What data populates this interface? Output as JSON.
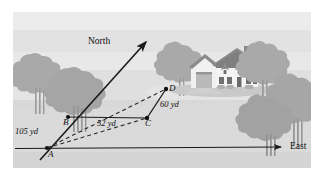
{
  "figure": {
    "background_color": "#ffffff",
    "scene_color": "#d9d9d9",
    "sky_band_color": "#e6e6e6",
    "mid_band_color": "#dedede",
    "ground_color": "#d5d5d5",
    "tree_color": "#a8a8a8",
    "tree_trunk_color": "#8f8f8f",
    "house_wall_color": "#f2f2f2",
    "house_roof_color": "#8d8d8d",
    "line_color": "#1a1a1a"
  },
  "direction_labels": {
    "north": "North",
    "east": "East"
  },
  "points": [
    {
      "id": "A",
      "label": "A",
      "x": 47,
      "y": 148
    },
    {
      "id": "B",
      "label": "B",
      "x": 68,
      "y": 117
    },
    {
      "id": "C",
      "label": "C",
      "x": 147,
      "y": 118
    },
    {
      "id": "D",
      "label": "D",
      "x": 166,
      "y": 89
    }
  ],
  "measurements": [
    {
      "id": "AB",
      "label": "105 yd",
      "value": 105,
      "unit": "yd",
      "from": "A",
      "to": "B"
    },
    {
      "id": "BC",
      "label": "52 yd",
      "value": 52,
      "unit": "yd",
      "from": "B",
      "to": "C"
    },
    {
      "id": "CD",
      "label": "60 yd",
      "value": 60,
      "unit": "yd",
      "from": "C",
      "to": "D"
    }
  ],
  "segments": [
    {
      "id": "north-axis",
      "style": "solid",
      "arrow": true
    },
    {
      "id": "east-axis",
      "style": "solid",
      "arrow": true
    },
    {
      "id": "segment-BC",
      "style": "solid",
      "arrow": false
    },
    {
      "id": "segment-CD",
      "style": "solid",
      "arrow": false
    },
    {
      "id": "segment-AC",
      "style": "dashed",
      "arrow": false
    },
    {
      "id": "segment-AD",
      "style": "dashed",
      "arrow": false
    }
  ],
  "scenery": {
    "house": "house",
    "trees_left": 2,
    "trees_right": 4
  }
}
